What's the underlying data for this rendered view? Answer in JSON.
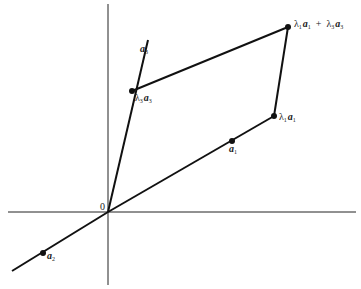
{
  "diagram": {
    "origin_label": "0",
    "labels": {
      "a1": {
        "symbol": "a",
        "sub": "1"
      },
      "a2": {
        "symbol": "a",
        "sub": "2"
      },
      "a3": {
        "symbol": "a",
        "sub": "3"
      },
      "lambda1_a1": {
        "lambda": "λ",
        "lsub": "1",
        "symbol": "a",
        "sub": "1"
      },
      "lambda3_a3": {
        "lambda": "λ",
        "lsub": "3",
        "symbol": "a",
        "sub": "3"
      },
      "sum": {
        "t1": {
          "lambda": "λ",
          "lsub": "1",
          "symbol": "a",
          "sub": "1"
        },
        "plus": "+",
        "t2": {
          "lambda": "λ",
          "lsub": "3",
          "symbol": "a",
          "sub": "3"
        }
      }
    },
    "colors": {
      "stroke": "#111111",
      "background": "#ffffff"
    }
  }
}
